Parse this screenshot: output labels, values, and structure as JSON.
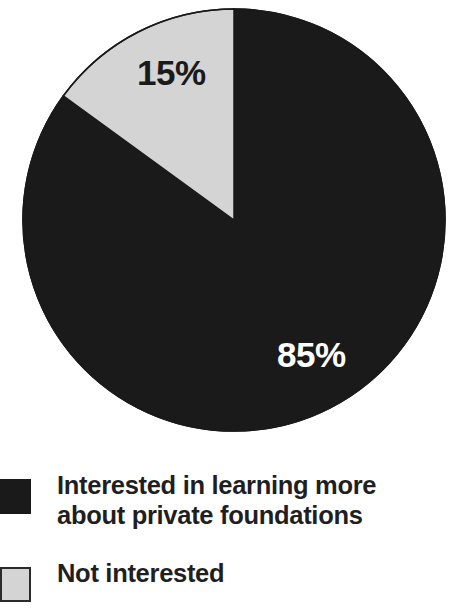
{
  "chart_data": {
    "type": "pie",
    "title": "",
    "subtitle": "",
    "xlabel": "",
    "ylabel": "",
    "grid": false,
    "legend_position": "bottom-left",
    "start_angle_deg": 0,
    "direction": "clockwise",
    "categories": [
      "Interested in learning more about private foundations",
      "Not interested"
    ],
    "values": [
      85,
      15
    ],
    "value_unit": "%",
    "slices": [
      {
        "label": "Interested in learning more about private foundations",
        "value": 85,
        "data_label": "85%",
        "color": "#1a1a1a",
        "label_text_color": "#ffffff",
        "start_angle_deg": 0,
        "end_angle_deg": 306
      },
      {
        "label": "Not interested",
        "value": 15,
        "data_label": "15%",
        "color": "#d4d4d4",
        "label_text_color": "#1a1a1a",
        "start_angle_deg": 306,
        "end_angle_deg": 360
      }
    ],
    "annotations": []
  },
  "pie": {
    "center_x": 234,
    "center_y": 220,
    "radius": 211,
    "outline_color": "#1a1a1a",
    "labels": {
      "slice_85": "85%",
      "slice_15": "15%"
    }
  },
  "legend": {
    "items": [
      {
        "swatch_color": "#1a1a1a",
        "swatch_style": "dark",
        "label": "Interested in learning more about private foundations"
      },
      {
        "swatch_color": "#d4d4d4",
        "swatch_style": "light",
        "label": "Not interested"
      }
    ]
  },
  "colors": {
    "background": "#ffffff",
    "dark_slice": "#1a1a1a",
    "light_slice": "#d4d4d4",
    "swatch_border": "#2b2b2b",
    "text": "#1f1f1f",
    "inverse_text": "#ffffff"
  }
}
